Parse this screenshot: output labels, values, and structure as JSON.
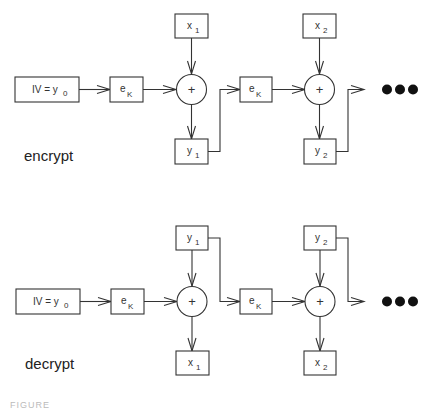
{
  "diagram": {
    "encrypt": {
      "label": "encrypt",
      "iv_box": {
        "main": "IV = y",
        "sub": "0"
      },
      "ek_boxes": [
        {
          "main": "e",
          "sub": "K"
        },
        {
          "main": "e",
          "sub": "K"
        }
      ],
      "xor_symbol": "+",
      "input_boxes": [
        {
          "main": "x",
          "sub": "1"
        },
        {
          "main": "x",
          "sub": "2"
        }
      ],
      "output_boxes": [
        {
          "main": "y",
          "sub": "1"
        },
        {
          "main": "y",
          "sub": "2"
        }
      ],
      "continuation": "•••"
    },
    "decrypt": {
      "label": "decrypt",
      "iv_box": {
        "main": "IV = y",
        "sub": "0"
      },
      "ek_boxes": [
        {
          "main": "e",
          "sub": "K"
        },
        {
          "main": "e",
          "sub": "K"
        }
      ],
      "xor_symbol": "+",
      "input_boxes": [
        {
          "main": "y",
          "sub": "1"
        },
        {
          "main": "y",
          "sub": "2"
        }
      ],
      "output_boxes": [
        {
          "main": "x",
          "sub": "1"
        },
        {
          "main": "x",
          "sub": "2"
        }
      ],
      "continuation": "•••"
    },
    "caption": "FIGURE"
  }
}
